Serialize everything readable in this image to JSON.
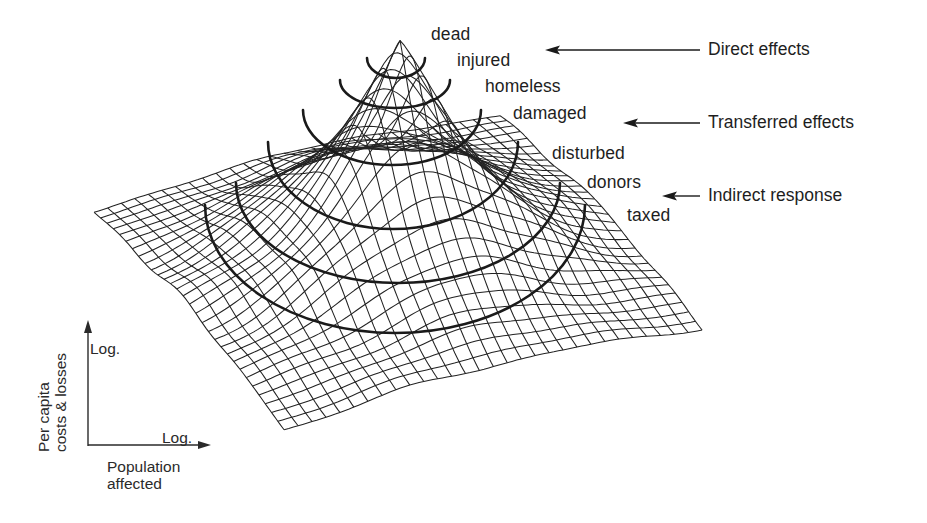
{
  "figure": {
    "ring_labels": [
      {
        "text": "dead",
        "x": 431,
        "y": 26
      },
      {
        "text": "injured",
        "x": 457,
        "y": 52
      },
      {
        "text": "homeless",
        "x": 485,
        "y": 78
      },
      {
        "text": "damaged",
        "x": 513,
        "y": 105
      },
      {
        "text": "disturbed",
        "x": 552,
        "y": 145
      },
      {
        "text": "donors",
        "x": 587,
        "y": 174
      },
      {
        "text": "taxed",
        "x": 627,
        "y": 207
      }
    ],
    "effects": [
      {
        "label": "Direct effects",
        "x": 708,
        "y": 40,
        "arrow_from_x": 700,
        "arrow_to_x": 545,
        "arrow_y": 50
      },
      {
        "label": "Transferred effects",
        "x": 708,
        "y": 114,
        "arrow_from_x": 700,
        "arrow_to_x": 623,
        "arrow_y": 123
      },
      {
        "label": "Indirect response",
        "x": 708,
        "y": 187,
        "arrow_from_x": 700,
        "arrow_to_x": 662,
        "arrow_y": 196
      }
    ],
    "axes": {
      "y_title_line1": "Per capita",
      "y_title_line2": "costs & losses",
      "y_scale": "Log.",
      "x_title_line1": "Population",
      "x_title_line2": "affected",
      "x_scale": "Log."
    },
    "contour_rings": [
      {
        "level": "dead",
        "cx": 396,
        "top": 58,
        "bottom": 78,
        "half_width": 29
      },
      {
        "level": "injured",
        "cx": 395,
        "top": 80,
        "bottom": 108,
        "half_width": 55
      },
      {
        "level": "homeless",
        "cx": 392,
        "top": 110,
        "bottom": 165,
        "half_width": 89
      },
      {
        "level": "damaged",
        "cx": 393,
        "top": 142,
        "bottom": 229,
        "half_width": 125
      },
      {
        "level": "disturbed",
        "cx": 398,
        "top": 183,
        "bottom": 283,
        "half_width": 162
      },
      {
        "level": "donors",
        "cx": 395,
        "top": 205,
        "bottom": 333,
        "half_width": 190
      }
    ],
    "surface_corners": {
      "left": [
        94,
        218
      ],
      "bottom": [
        284,
        435
      ],
      "right": [
        702,
        334
      ],
      "back": [
        500,
        122
      ],
      "peak": [
        400,
        43
      ]
    },
    "colors": {
      "ink": "#1a1a1a",
      "mesh": "#222222",
      "background": "#ffffff"
    }
  }
}
